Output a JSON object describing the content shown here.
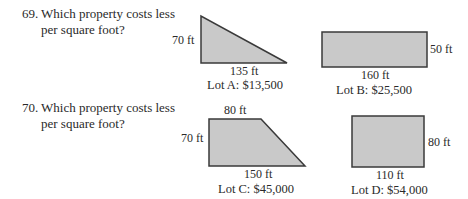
{
  "problems": [
    {
      "number": "69.",
      "question_line1": "Which property costs less",
      "question_line2": "per square foot?",
      "lots": [
        {
          "shape": "right-triangle",
          "height_label": "70 ft",
          "base_label": "135 ft",
          "caption": "Lot A:  $13,500"
        },
        {
          "shape": "rectangle",
          "width_label": "160 ft",
          "height_label": "50 ft",
          "caption": "Lot B:  $25,500"
        }
      ]
    },
    {
      "number": "70.",
      "question_line1": "Which property costs less",
      "question_line2": "per square foot?",
      "lots": [
        {
          "shape": "trapezoid",
          "top_label": "80 ft",
          "height_label": "70 ft",
          "base_label": "150 ft",
          "caption": "Lot C:  $45,000"
        },
        {
          "shape": "rectangle",
          "width_label": "110 ft",
          "height_label": "80 ft",
          "caption": "Lot D:  $54,000"
        }
      ]
    }
  ],
  "colors": {
    "shape_fill": "#c9c9c9",
    "shape_stroke": "#3a3a3a",
    "text": "#2a2a2a"
  }
}
